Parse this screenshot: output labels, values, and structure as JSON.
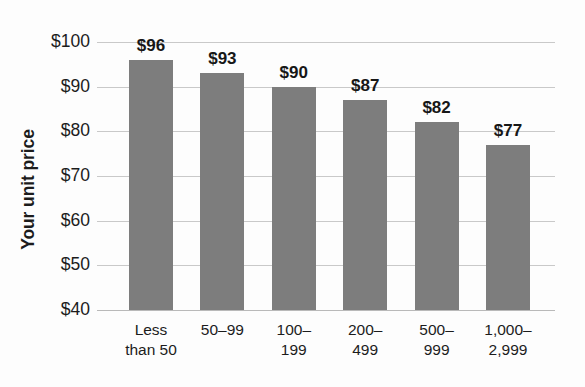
{
  "chart_data": {
    "type": "bar",
    "title": "",
    "xlabel": "",
    "ylabel": "Your unit price",
    "categories": [
      "Less than 50",
      "50–99",
      "100–199",
      "200–499",
      "500–999",
      "1,000–2,999"
    ],
    "category_lines": [
      {
        "l1": "Less",
        "l2": "than 50"
      },
      {
        "l1": "50–99",
        "l2": ""
      },
      {
        "l1": "100–",
        "l2": "199"
      },
      {
        "l1": "200–",
        "l2": "499"
      },
      {
        "l1": "500–",
        "l2": "999"
      },
      {
        "l1": "1,000–",
        "l2": "2,999"
      }
    ],
    "values": [
      96,
      93,
      90,
      87,
      82,
      77
    ],
    "value_labels": [
      "$96",
      "$93",
      "$90",
      "$87",
      "$82",
      "$77"
    ],
    "ylim": [
      40,
      100
    ],
    "ytick_values": [
      100,
      90,
      80,
      70,
      60,
      50,
      40
    ],
    "ytick_labels": [
      "$100",
      "$90",
      "$80",
      "$70",
      "$60",
      "$50",
      "$40"
    ],
    "grid": true,
    "legend": "none",
    "bar_color": "#7d7d7d",
    "gridline_color": "#c9c9c9",
    "text_color": "#1c1c1c",
    "background_color": "#fdfdfd"
  }
}
